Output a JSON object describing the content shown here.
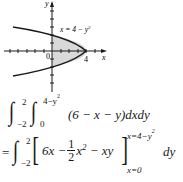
{
  "figure": {
    "curve_label": "x = 4 − y",
    "curve_label_exp": "2",
    "axis_x_label": "x",
    "axis_y_label": "y",
    "origin_label": "0",
    "vertex_label": "4",
    "shade_color": "#d9d9d9",
    "line_color": "#1a1a1a"
  },
  "equation1": {
    "outer_lower": "−2",
    "outer_upper": "2",
    "inner_lower": "0",
    "inner_upper": "4−y",
    "inner_upper_exp": "2",
    "integrand": "(6 − x − y)dxdy"
  },
  "equation2": {
    "eq": "=",
    "outer_lower": "−2",
    "outer_upper": "2",
    "term1": "6x −",
    "frac_num": "1",
    "frac_den": "2",
    "term2": "x",
    "term2_exp": "2",
    "term3": " − xy",
    "eval_upper": "x=4−y",
    "eval_upper_exp": "2",
    "eval_lower": "x=0",
    "dy": "dy"
  }
}
